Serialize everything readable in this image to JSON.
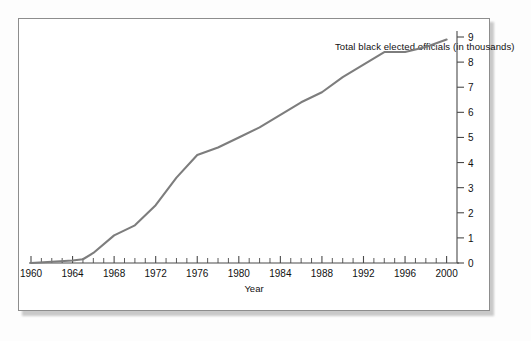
{
  "figure": {
    "title": "Total black elected officials (in thousands)",
    "line_color": "#7d7d7d",
    "axis_color": "#4a4a4a",
    "frame_color": "#8d8d8d"
  },
  "chart_data": {
    "type": "line",
    "title": "Total black elected officials (in thousands)",
    "xlabel": "Year",
    "ylabel": "",
    "xlim": [
      1960,
      2001
    ],
    "ylim": [
      0,
      9
    ],
    "grid": false,
    "legend": "none",
    "y_axis_position": "right",
    "xticks": [
      1960,
      1964,
      1968,
      1972,
      1976,
      1980,
      1984,
      1988,
      1992,
      1996,
      2000
    ],
    "xtick_labels": [
      "1960",
      "1964",
      "1968",
      "1972",
      "1976",
      "1980",
      "1984",
      "1988",
      "1992",
      "1996",
      "2000"
    ],
    "xminor_tick_interval": 1,
    "yticks": [
      0,
      1,
      2,
      3,
      4,
      5,
      6,
      7,
      8,
      9
    ],
    "ytick_labels": [
      "0",
      "1",
      "2",
      "3",
      "4",
      "5",
      "6",
      "7",
      "8",
      "9"
    ],
    "x": [
      1960,
      1962,
      1964,
      1965,
      1966,
      1968,
      1970,
      1972,
      1974,
      1976,
      1978,
      1980,
      1982,
      1984,
      1986,
      1988,
      1990,
      1992,
      1994,
      1996,
      1998,
      2000
    ],
    "values": [
      0.0,
      0.05,
      0.1,
      0.15,
      0.4,
      1.1,
      1.5,
      2.3,
      3.4,
      4.3,
      4.6,
      5.0,
      5.4,
      5.9,
      6.4,
      6.8,
      7.4,
      7.9,
      8.4,
      8.4,
      8.6,
      8.9
    ],
    "series": [
      {
        "name": "Total black elected officials",
        "values": [
          0.0,
          0.05,
          0.1,
          0.15,
          0.4,
          1.1,
          1.5,
          2.3,
          3.4,
          4.3,
          4.6,
          5.0,
          5.4,
          5.9,
          6.4,
          6.8,
          7.4,
          7.9,
          8.4,
          8.4,
          8.6,
          8.9
        ]
      }
    ]
  }
}
